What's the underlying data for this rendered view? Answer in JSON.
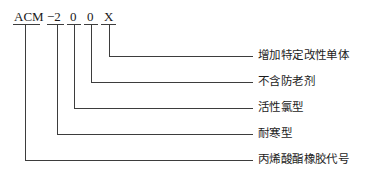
{
  "diagram": {
    "title_code": "ACM-200X",
    "code_segments": [
      {
        "id": "base",
        "text": "ACM",
        "x": 14,
        "y": 10,
        "underline_x1": 13,
        "underline_x2": 40,
        "stem_x": 25
      },
      {
        "id": "dash2",
        "text": "−2",
        "x": 48,
        "y": 10,
        "underline_x1": 47,
        "underline_x2": 64,
        "stem_x": 57
      },
      {
        "id": "digit0a",
        "text": "0",
        "x": 70,
        "y": 10,
        "underline_x1": 67,
        "underline_x2": 80,
        "stem_x": 74
      },
      {
        "id": "digit0b",
        "text": "0",
        "x": 87,
        "y": 10,
        "underline_x1": 84,
        "underline_x2": 97,
        "stem_x": 91
      },
      {
        "id": "letterX",
        "text": "X",
        "x": 104,
        "y": 10,
        "underline_x1": 102,
        "underline_x2": 116,
        "stem_x": 109
      }
    ],
    "underline_y": 24,
    "callouts": [
      {
        "id": "modifier-monomer",
        "label": "增加特定改性单体",
        "stem_x": 109,
        "corner_y": 56,
        "line_end_x": 253,
        "text_x": 258,
        "text_y": 50
      },
      {
        "id": "no-antioxidant",
        "label": "不含防老剂",
        "stem_x": 91,
        "corner_y": 82,
        "line_end_x": 253,
        "text_x": 258,
        "text_y": 76
      },
      {
        "id": "active-chlorine-type",
        "label": "活性氯型",
        "stem_x": 74,
        "corner_y": 108,
        "line_end_x": 253,
        "text_x": 258,
        "text_y": 102
      },
      {
        "id": "cold-resistant-type",
        "label": "耐寒型",
        "stem_x": 57,
        "corner_y": 134,
        "line_end_x": 253,
        "text_x": 258,
        "text_y": 128
      },
      {
        "id": "acrylate-rubber-code",
        "label": "丙烯酸酯橡胶代号",
        "stem_x": 25,
        "corner_y": 160,
        "line_end_x": 253,
        "text_x": 258,
        "text_y": 154
      }
    ],
    "line_color": "#3d3d3d",
    "text_color": "#1c1c1c",
    "background_color": "#ffffff"
  }
}
